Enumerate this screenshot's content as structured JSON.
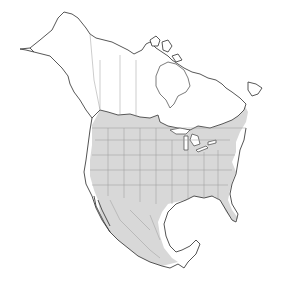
{
  "map": {
    "region": "North America",
    "type": "species range map",
    "colors": {
      "background": "#ffffff",
      "land": "#ffffff",
      "range_fill": "#d8d8d8",
      "coastline": "#444444",
      "political_borders": "#9a9a9a"
    },
    "range_description": "Shaded range covering contiguous United States, southern Canada and most of Mexico",
    "legend": null,
    "labels": []
  }
}
